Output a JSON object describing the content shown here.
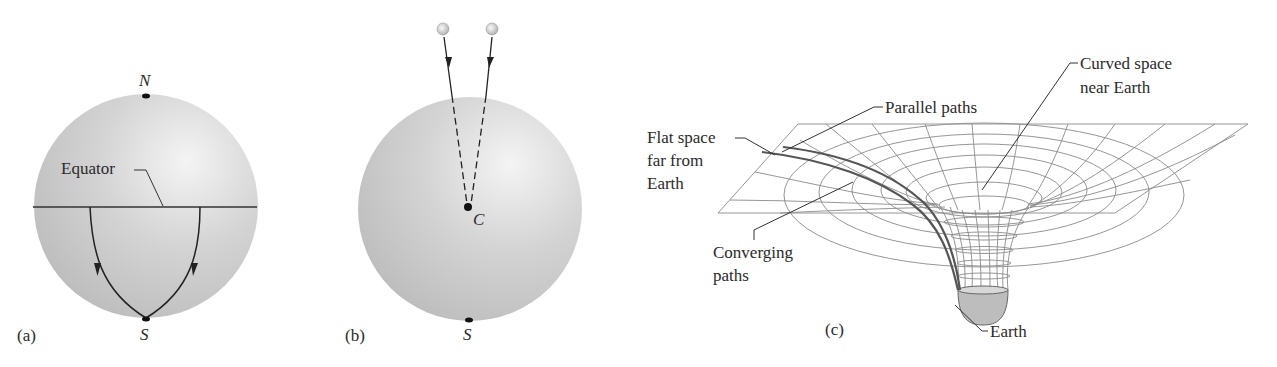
{
  "figure": {
    "panels": [
      {
        "id": "a",
        "label": "(a)",
        "points": {
          "north": "N",
          "south": "S"
        },
        "callouts": {
          "equator": "Equator"
        }
      },
      {
        "id": "b",
        "label": "(b)",
        "points": {
          "center": "C",
          "south": "S"
        }
      },
      {
        "id": "c",
        "label": "(c)",
        "callouts": {
          "parallel_paths": "Parallel paths",
          "curved_space_line1": "Curved space",
          "curved_space_line2": "near Earth",
          "flat_space_line1": "Flat space",
          "flat_space_line2": "far from",
          "flat_space_line3": "Earth",
          "converging_line1": "Converging",
          "converging_line2": "paths",
          "earth": "Earth"
        }
      }
    ]
  },
  "colors": {
    "sphere_light": "#f2f2f2",
    "sphere_dark": "#b8b8b8",
    "grid": "#8a8a8a",
    "earth": "#bdbdbd"
  }
}
